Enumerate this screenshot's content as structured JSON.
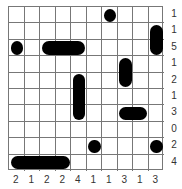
{
  "puzzle": {
    "type": "battleships",
    "rows": 10,
    "cols": 10,
    "row_clues": [
      "1",
      "1",
      "5",
      "1",
      "2",
      "1",
      "3",
      "0",
      "2",
      "4"
    ],
    "col_clues": [
      "2",
      "1",
      "2",
      "2",
      "4",
      "1",
      "1",
      "3",
      "1",
      "3"
    ],
    "segments": [
      {
        "r": 0,
        "c": 6,
        "shape": "circle"
      },
      {
        "r": 1,
        "c": 9,
        "shape": "top"
      },
      {
        "r": 2,
        "c": 9,
        "shape": "bottom"
      },
      {
        "r": 2,
        "c": 0,
        "shape": "circle"
      },
      {
        "r": 2,
        "c": 2,
        "shape": "left"
      },
      {
        "r": 2,
        "c": 3,
        "shape": "mid"
      },
      {
        "r": 2,
        "c": 4,
        "shape": "right"
      },
      {
        "r": 3,
        "c": 7,
        "shape": "top"
      },
      {
        "r": 4,
        "c": 7,
        "shape": "bottom"
      },
      {
        "r": 4,
        "c": 4,
        "shape": "top"
      },
      {
        "r": 5,
        "c": 4,
        "shape": "mid"
      },
      {
        "r": 6,
        "c": 4,
        "shape": "bottom"
      },
      {
        "r": 6,
        "c": 7,
        "shape": "left"
      },
      {
        "r": 6,
        "c": 8,
        "shape": "right"
      },
      {
        "r": 8,
        "c": 5,
        "shape": "circle"
      },
      {
        "r": 8,
        "c": 9,
        "shape": "circle"
      },
      {
        "r": 9,
        "c": 0,
        "shape": "left"
      },
      {
        "r": 9,
        "c": 1,
        "shape": "mid"
      },
      {
        "r": 9,
        "c": 2,
        "shape": "mid"
      },
      {
        "r": 9,
        "c": 3,
        "shape": "right"
      }
    ]
  },
  "colors": {
    "ship": "#000000",
    "grid": "#777777",
    "clue": "#333333"
  }
}
